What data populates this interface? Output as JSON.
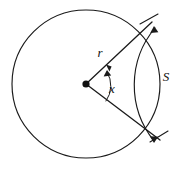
{
  "figure": {
    "background_color": "#ffffff",
    "stroke_color": "#1a1a1a",
    "labels": {
      "radius": "r",
      "angle": "x",
      "arc_length": "S"
    },
    "geometry": {
      "circle_center_x": 86,
      "circle_center_y": 84,
      "circle_radius": 74,
      "bracket_radius": 89,
      "sector_start_angle_deg": -40,
      "sector_end_angle_deg": 37,
      "center_dot_radius": 3.6
    },
    "elements": {
      "circle_name": "main circle",
      "radius_upper_name": "upper radius segment",
      "radius_lower_name": "lower radius segment",
      "angle_arc_name": "central angle arc",
      "bracket_name": "arc length measure bracket",
      "center_name": "circle center point"
    }
  }
}
